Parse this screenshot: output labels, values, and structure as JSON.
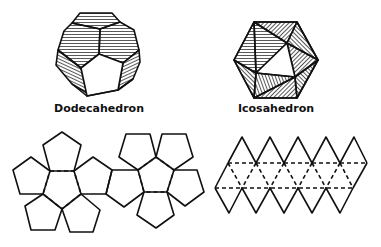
{
  "figure": {
    "solids": [
      {
        "id": "dodecahedron",
        "label": "Dodecahedron"
      },
      {
        "id": "icosahedron",
        "label": "Icosahedron"
      }
    ],
    "nets": [
      {
        "id": "dodecahedron-net",
        "faces": 12,
        "shape": "pentagon"
      },
      {
        "id": "icosahedron-net",
        "faces": 20,
        "shape": "triangle"
      }
    ],
    "colors": {
      "ink": "#111111",
      "background": "#ffffff"
    }
  }
}
